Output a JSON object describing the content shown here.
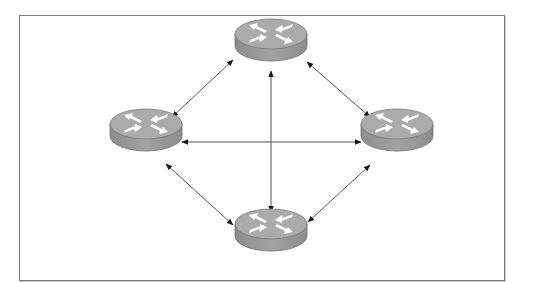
{
  "diagram": {
    "type": "full-mesh-network",
    "colors": {
      "frame_border": "#7a7a7a",
      "router_top": "#ababab",
      "router_side": "#989898",
      "router_edge": "#6e6e6e",
      "router_arrows": "#ffffff",
      "link": "#555555",
      "arrowhead": "#1a1a1a"
    },
    "nodes": [
      {
        "id": "router-top",
        "icon": "router-icon",
        "cx": 271,
        "cy": 42
      },
      {
        "id": "router-left",
        "icon": "router-icon",
        "cx": 146,
        "cy": 132
      },
      {
        "id": "router-right",
        "icon": "router-icon",
        "cx": 397,
        "cy": 132
      },
      {
        "id": "router-bottom",
        "icon": "router-icon",
        "cx": 271,
        "cy": 232
      }
    ],
    "links": [
      {
        "from": "router-left",
        "to": "router-top",
        "x1": 172,
        "y1": 117,
        "x2": 233,
        "y2": 60
      },
      {
        "from": "router-top",
        "to": "router-right",
        "x1": 307,
        "y1": 62,
        "x2": 370,
        "y2": 117
      },
      {
        "from": "router-left",
        "to": "router-right",
        "x1": 182,
        "y1": 142,
        "x2": 361,
        "y2": 142
      },
      {
        "from": "router-top",
        "to": "router-bottom",
        "x1": 271,
        "y1": 71,
        "x2": 271,
        "y2": 212
      },
      {
        "from": "router-left",
        "to": "router-bottom",
        "x1": 166,
        "y1": 164,
        "x2": 233,
        "y2": 225
      },
      {
        "from": "router-right",
        "to": "router-bottom",
        "x1": 370,
        "y1": 165,
        "x2": 308,
        "y2": 222
      }
    ]
  }
}
